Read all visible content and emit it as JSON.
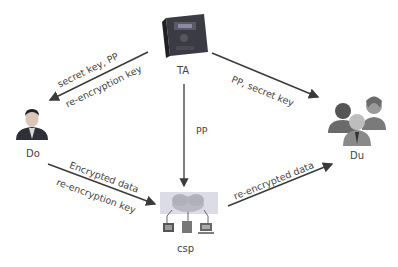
{
  "nodes": {
    "ta": {
      "label": "TA",
      "icon": "server-icon"
    },
    "do": {
      "label": "Do",
      "icon": "user-icon"
    },
    "du": {
      "label": "Du",
      "icon": "user-group-icon"
    },
    "csp": {
      "label": "csp",
      "icon": "cloud-network-icon"
    }
  },
  "edges": {
    "ta_to_do": {
      "line1": "secret key,  PP",
      "line2": "re-encryption key"
    },
    "ta_to_du": {
      "label": "PP,  secret key"
    },
    "ta_to_csp": {
      "label": "PP"
    },
    "do_to_csp": {
      "line1": "Encrypted data",
      "line2": "re-encryption key"
    },
    "csp_to_du": {
      "label": "re-encrypted data"
    }
  },
  "colors": {
    "line": "#3a3a3a",
    "server_body": "#2f2f36",
    "cloud": "#b9b9c4"
  }
}
